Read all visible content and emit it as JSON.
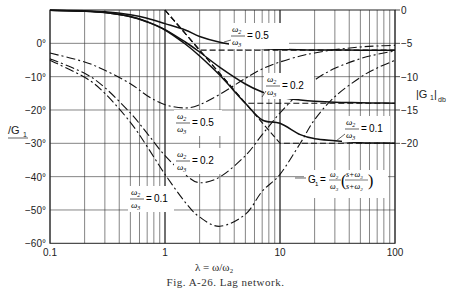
{
  "figure": {
    "caption": "Fig. A-26. Lag network.",
    "xlabel": "λ = ω/ω₂",
    "left_axis_label": "/G₁",
    "right_axis_label": "|G₁|db",
    "formula": "G₁ = (ω₂/ω₃)((s+ω₃)/(s+ω₂))"
  },
  "chart_data": {
    "type": "line",
    "title": "Lag network",
    "xlabel": "λ = ω/ω₂",
    "ylabel_left": "/G₁ (degrees)",
    "ylabel_right": "|G₁| (db)",
    "xscale": "log",
    "xlim": [
      0.1,
      100
    ],
    "x_ticks": [
      0.1,
      1,
      10,
      100
    ],
    "x_tick_labels": [
      "0.1",
      "1",
      "10",
      "100"
    ],
    "ylim_left": [
      -60,
      10
    ],
    "y_ticks_left": [
      0,
      -10,
      -20,
      -30,
      -40,
      -50,
      -60
    ],
    "y_tick_labels_left": [
      "0°",
      "-10°",
      "-20°",
      "-30°",
      "-40°",
      "-50°",
      "-60°"
    ],
    "ylim_right": [
      -35,
      0
    ],
    "y_ticks_right": [
      0,
      -5,
      -10,
      -15,
      -20
    ],
    "y_tick_labels_right": [
      "0",
      "-5",
      "-10",
      "-15",
      "-20"
    ],
    "grid": true,
    "lambda": [
      0.1,
      0.2,
      0.3,
      0.5,
      0.7,
      1,
      1.5,
      2,
      3,
      5,
      7,
      10,
      15,
      20,
      30,
      50,
      70,
      100
    ],
    "series": [
      {
        "name": "|G1| ω2/ω3=0.5",
        "kind": "magnitude",
        "style": "solid",
        "values": [
          -0.03,
          -0.13,
          -0.28,
          -0.72,
          -1.23,
          -2.04,
          -3.0,
          -3.98,
          -4.85,
          -5.5,
          -5.77,
          -5.9,
          -5.97,
          -6.0,
          -6.01,
          -6.02,
          -6.02,
          -6.02
        ]
      },
      {
        "name": "|G1| ω2/ω3=0.2",
        "kind": "magnitude",
        "style": "solid",
        "values": [
          -0.04,
          -0.17,
          -0.37,
          -0.96,
          -1.74,
          -2.94,
          -4.8,
          -6.3,
          -8.6,
          -11.1,
          -12.3,
          -13.1,
          -13.5,
          -13.7,
          -13.85,
          -13.9,
          -13.95,
          -13.98
        ]
      },
      {
        "name": "|G1| ω2/ω3=0.1",
        "kind": "magnitude",
        "style": "solid",
        "values": [
          -0.04,
          -0.17,
          -0.39,
          -1.0,
          -1.8,
          -3.0,
          -5.1,
          -6.9,
          -9.8,
          -14.0,
          -16.5,
          -17.0,
          -18.7,
          -19.3,
          -19.6,
          -19.9,
          -19.95,
          -20.0
        ]
      },
      {
        "name": "/G1 ω2/ω3=0.5",
        "kind": "phase",
        "style": "dashdot",
        "values": [
          -2.9,
          -5.6,
          -8.1,
          -12.1,
          -15.7,
          -18.4,
          -19.4,
          -18.4,
          -15.3,
          -10.5,
          -7.7,
          -5.6,
          -3.8,
          -2.9,
          -1.9,
          -1.1,
          -0.8,
          -0.6
        ]
      },
      {
        "name": "/G1 ω2/ω3=0.2",
        "kind": "phase",
        "style": "dashdot",
        "values": [
          -4.6,
          -9.0,
          -13.3,
          -20.9,
          -27.0,
          -33.7,
          -39.4,
          -41.8,
          -40.1,
          -33.7,
          -27.4,
          -20.9,
          -14.6,
          -11.0,
          -7.5,
          -4.6,
          -3.3,
          -2.3
        ]
      },
      {
        "name": "/G1 ω2/ω3=0.1",
        "kind": "phase",
        "style": "dashdot",
        "values": [
          -5.1,
          -10.2,
          -15.0,
          -23.7,
          -31.0,
          -39.3,
          -47.7,
          -52.1,
          -54.9,
          -51.3,
          -44.4,
          -39.3,
          -30.0,
          -22.9,
          -16.0,
          -10.2,
          -7.4,
          -5.1
        ]
      }
    ],
    "asymptotes": [
      {
        "name": "asymptote 0.5",
        "corner_low": 1,
        "corner_high": 2,
        "final_db": -6.02
      },
      {
        "name": "asymptote 0.2",
        "corner_low": 1,
        "corner_high": 5,
        "final_db": -13.98
      },
      {
        "name": "asymptote 0.1",
        "corner_low": 1,
        "corner_high": 10,
        "final_db": -20.0
      }
    ],
    "annotations": [
      {
        "text": "ω2/ω3 = 0.5",
        "target": "magnitude 0.5"
      },
      {
        "text": "ω2/ω3 = 0.2",
        "target": "magnitude 0.2"
      },
      {
        "text": "ω2/ω3 = 0.1",
        "target": "magnitude 0.1"
      },
      {
        "text": "ω2/ω3 = 0.5",
        "target": "phase 0.5"
      },
      {
        "text": "ω2/ω3 = 0.2",
        "target": "phase 0.2"
      },
      {
        "text": "ω2/ω3 = 0.1",
        "target": "phase 0.1"
      },
      {
        "text": "G1 = (ω2/ω3)((s+ω3)/(s+ω2))",
        "target": "formula"
      }
    ]
  },
  "labels": {
    "mag05": "0.5",
    "mag02": "0.2",
    "mag01": "0.1",
    "ph05": "0.5",
    "ph02": "0.2",
    "ph01": "0.1"
  }
}
